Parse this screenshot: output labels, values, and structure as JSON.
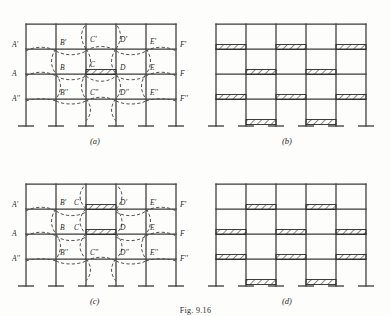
{
  "figure": {
    "caption": "Fig. 9.16",
    "panels": [
      {
        "id": "a",
        "label": "(a)"
      },
      {
        "id": "b",
        "label": "(b)"
      },
      {
        "id": "c",
        "label": "(c)"
      },
      {
        "id": "d",
        "label": "(d)"
      }
    ]
  },
  "frame": {
    "bays": 5,
    "columns": 6,
    "stories": 4,
    "beam_rows": 4,
    "support_type": "fixed",
    "line_color": "#3a3a3a",
    "deflection_color": "#4a4a4a",
    "hatch_color": "#2b2b2b"
  },
  "joint_labels": {
    "upper_floor": [
      "A'",
      "B'",
      "C'",
      "D'",
      "E'",
      "F'"
    ],
    "middle_floor": [
      "A",
      "B",
      "C",
      "D",
      "E",
      "F"
    ],
    "lower_floor": [
      "A''",
      "B''",
      "C''",
      "D''",
      "E''",
      "F''"
    ]
  },
  "panel_a": {
    "label": "(a)",
    "description": "single loaded span CD on middle floor with deflected shape",
    "loaded_beams": [
      {
        "row": 3,
        "span": 3
      }
    ],
    "deflection_rows": [
      2,
      3,
      4
    ]
  },
  "panel_b": {
    "label": "(b)",
    "description": "checkerboard alternate-span loading pattern",
    "loaded_beams": [
      {
        "row": 1,
        "spans": [
          1,
          3,
          5
        ]
      },
      {
        "row": 2,
        "spans": [
          2,
          4
        ]
      },
      {
        "row": 3,
        "spans": [
          1,
          3,
          5
        ]
      },
      {
        "row": 4,
        "spans": [
          2,
          4
        ]
      }
    ]
  },
  "panel_c": {
    "label": "(c)",
    "description": "two vertically adjacent loaded spans C'D' and CD with deflected shape",
    "loaded_beams": [
      {
        "row": 2,
        "span": 3
      },
      {
        "row": 3,
        "span": 3
      }
    ],
    "deflection_rows": [
      2,
      3,
      4
    ]
  },
  "panel_d": {
    "label": "(d)",
    "description": "alternate-span loading with adjacent floors loaded alike",
    "loaded_beams": [
      {
        "row": 1,
        "spans": [
          2,
          4
        ]
      },
      {
        "row": 2,
        "spans": [
          1,
          3,
          5
        ]
      },
      {
        "row": 3,
        "spans": [
          1,
          3,
          5
        ]
      },
      {
        "row": 4,
        "spans": [
          2,
          4
        ]
      }
    ]
  }
}
